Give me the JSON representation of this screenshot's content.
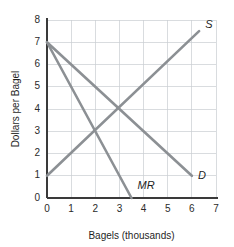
{
  "chart_data": {
    "type": "line",
    "title": "",
    "xlabel": "Bagels (thousands)",
    "ylabel": "Dollars per Bagel",
    "xlim": [
      0,
      7
    ],
    "ylim": [
      0,
      8
    ],
    "xticks": [
      "0",
      "1",
      "2",
      "3",
      "4",
      "5",
      "6",
      "7"
    ],
    "yticks": [
      "0",
      "1",
      "2",
      "3",
      "4",
      "5",
      "6",
      "7",
      "8"
    ],
    "grid": true,
    "legend": "inline-labels",
    "line_color": "#8c9094",
    "axis_color": "#3a3a3a",
    "grid_color": "#c9cdd2",
    "series": [
      {
        "name": "S",
        "label": "S",
        "label_x": 6.55,
        "label_y": 7.75,
        "points": [
          [
            0,
            1
          ],
          [
            6.3,
            7.5
          ]
        ]
      },
      {
        "name": "D",
        "label": "D",
        "label_x": 6.25,
        "label_y": 1.0,
        "points": [
          [
            0,
            7
          ],
          [
            6,
            1
          ]
        ]
      },
      {
        "name": "MR",
        "label": "MR",
        "label_x": 3.75,
        "label_y": 0.55,
        "points": [
          [
            0,
            7
          ],
          [
            3.5,
            0
          ]
        ]
      }
    ],
    "annotations": [
      {
        "name": "equilibrium-supply-demand",
        "x": 3,
        "y": 4
      },
      {
        "name": "intersection-supply-mr",
        "x": 2,
        "y": 3
      }
    ]
  }
}
